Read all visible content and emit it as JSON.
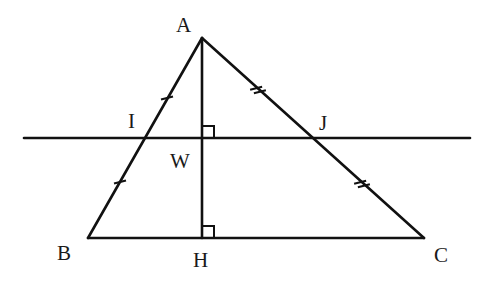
{
  "diagram": {
    "type": "geometry-triangle",
    "stroke_color": "#111111",
    "background": "#ffffff",
    "points": {
      "A": {
        "label": "A",
        "x": 202,
        "y": 38,
        "label_x": 176,
        "label_y": 32
      },
      "B": {
        "label": "B",
        "x": 88,
        "y": 238,
        "label_x": 57,
        "label_y": 260
      },
      "C": {
        "label": "C",
        "x": 424,
        "y": 238,
        "label_x": 434,
        "label_y": 262
      },
      "H": {
        "label": "H",
        "x": 202,
        "y": 238,
        "label_x": 193,
        "label_y": 267
      },
      "I": {
        "label": "I",
        "x": 145,
        "y": 138,
        "label_x": 128,
        "label_y": 128
      },
      "J": {
        "label": "J",
        "x": 313,
        "y": 138,
        "label_x": 319,
        "label_y": 130
      },
      "W": {
        "label": "W",
        "x": 202,
        "y": 138,
        "label_x": 170,
        "label_y": 168
      }
    },
    "segments": [
      {
        "name": "AB",
        "from": "A",
        "to": "B"
      },
      {
        "name": "AC",
        "from": "A",
        "to": "C"
      },
      {
        "name": "BC",
        "from": "B",
        "to": "C"
      },
      {
        "name": "AH",
        "from": "A",
        "to": "H"
      }
    ],
    "horizontal_line": {
      "x1": 24,
      "x2": 470,
      "y": 138,
      "passes_through": [
        "I",
        "W",
        "J"
      ]
    },
    "right_angles": [
      {
        "at": "W",
        "x": 202,
        "y": 138
      },
      {
        "at": "H",
        "x": 202,
        "y": 238
      }
    ],
    "tick_marks": [
      {
        "segment": "AI",
        "count": 1,
        "x": 167,
        "y": 98
      },
      {
        "segment": "IB",
        "count": 1,
        "x": 120,
        "y": 182
      },
      {
        "segment": "AJ",
        "count": 2,
        "x": 258,
        "y": 90
      },
      {
        "segment": "JC",
        "count": 2,
        "x": 362,
        "y": 184
      }
    ]
  }
}
